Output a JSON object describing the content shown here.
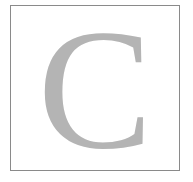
{
  "letter": {
    "text": "C",
    "color": "#b4b4b4"
  },
  "frame": {
    "border_color": "#8a8a8a",
    "background": "#ffffff"
  }
}
